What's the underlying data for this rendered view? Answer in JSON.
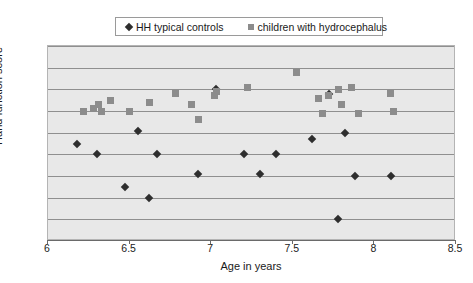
{
  "chart_data": {
    "type": "scatter",
    "title": "",
    "xlabel": "Age in years",
    "ylabel": "Hand function score",
    "xlim": [
      6,
      8.5
    ],
    "ylim": [
      0,
      90
    ],
    "xticks": [
      "6",
      "6.5",
      "7",
      "7.5",
      "8",
      "8.5"
    ],
    "xtick_values": [
      6,
      6.5,
      7,
      7.5,
      8,
      8.5
    ],
    "yticks": [
      "0",
      "10",
      "20",
      "30",
      "40",
      "50",
      "60",
      "70",
      "80",
      "90"
    ],
    "ytick_values": [
      0,
      10,
      20,
      30,
      40,
      50,
      60,
      70,
      80,
      90
    ],
    "grid": "horizontal",
    "legend_position": "top-center",
    "series": [
      {
        "name": "HH typical controls",
        "marker": "diamond",
        "color": "#2e2e2e",
        "points": [
          [
            6.18,
            45
          ],
          [
            6.3,
            40
          ],
          [
            6.47,
            25
          ],
          [
            6.55,
            51
          ],
          [
            6.62,
            20
          ],
          [
            6.67,
            40
          ],
          [
            6.92,
            31
          ],
          [
            7.03,
            70
          ],
          [
            7.2,
            40
          ],
          [
            7.3,
            31
          ],
          [
            7.4,
            40
          ],
          [
            7.62,
            47
          ],
          [
            7.72,
            68
          ],
          [
            7.78,
            10
          ],
          [
            7.82,
            50
          ],
          [
            7.88,
            30
          ],
          [
            8.1,
            30
          ]
        ]
      },
      {
        "name": "children with hydrocephalus",
        "marker": "square",
        "color": "#8c8c8c",
        "points": [
          [
            6.22,
            60
          ],
          [
            6.28,
            61
          ],
          [
            6.31,
            63
          ],
          [
            6.33,
            60
          ],
          [
            6.38,
            65
          ],
          [
            6.5,
            60
          ],
          [
            6.62,
            64
          ],
          [
            6.78,
            68
          ],
          [
            6.88,
            63
          ],
          [
            6.92,
            56
          ],
          [
            7.02,
            67
          ],
          [
            7.03,
            69
          ],
          [
            7.22,
            71
          ],
          [
            7.52,
            78
          ],
          [
            7.66,
            66
          ],
          [
            7.68,
            59
          ],
          [
            7.72,
            67
          ],
          [
            7.78,
            70
          ],
          [
            7.8,
            63
          ],
          [
            7.86,
            71
          ],
          [
            7.9,
            59
          ],
          [
            8.1,
            68
          ],
          [
            8.12,
            60
          ]
        ]
      }
    ]
  },
  "legend": {
    "entries": [
      {
        "label": "HH typical controls",
        "marker": "diamond"
      },
      {
        "label": "children with hydrocephalus",
        "marker": "square"
      }
    ]
  }
}
